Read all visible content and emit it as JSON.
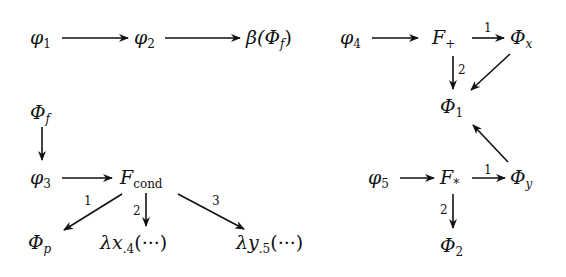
{
  "diagram": {
    "left_top_chain": {
      "nodes": [
        {
          "id": "phi1",
          "base": "φ",
          "sub": "1"
        },
        {
          "id": "phi2",
          "base": "φ",
          "sub": "2"
        },
        {
          "id": "beta_Phi_f",
          "prefix": "β(",
          "base": "Φ",
          "sub": "f",
          "suffix": ")"
        }
      ],
      "edges": [
        {
          "from": "phi1",
          "to": "phi2"
        },
        {
          "from": "phi2",
          "to": "beta_Phi_f"
        }
      ]
    },
    "left_bottom": {
      "nodes": [
        {
          "id": "Phi_f",
          "base": "Φ",
          "sub": "f"
        },
        {
          "id": "phi3",
          "base": "φ",
          "sub": "3"
        },
        {
          "id": "F_cond",
          "base": "F",
          "sub": "cond"
        },
        {
          "id": "Phi_p",
          "base": "Φ",
          "sub": "p"
        },
        {
          "id": "lambda_x",
          "base": "λx",
          "sub": ".4",
          "suffix": "(···)"
        },
        {
          "id": "lambda_y",
          "base": "λy",
          "sub": ".5",
          "suffix": "(···)"
        }
      ],
      "edges": [
        {
          "from": "Phi_f",
          "to": "phi3"
        },
        {
          "from": "phi3",
          "to": "F_cond"
        },
        {
          "from": "F_cond",
          "to": "Phi_p",
          "label": "1"
        },
        {
          "from": "F_cond",
          "to": "lambda_x",
          "label": "2"
        },
        {
          "from": "F_cond",
          "to": "lambda_y",
          "label": "3"
        }
      ]
    },
    "right": {
      "nodes": [
        {
          "id": "phi4",
          "base": "φ",
          "sub": "4"
        },
        {
          "id": "F_plus",
          "base": "F",
          "sub": "+"
        },
        {
          "id": "Phi_x",
          "base": "Φ",
          "sub": "x"
        },
        {
          "id": "Phi_1",
          "base": "Φ",
          "sub": "1"
        },
        {
          "id": "phi5",
          "base": "φ",
          "sub": "5"
        },
        {
          "id": "F_star",
          "base": "F",
          "sub": "*"
        },
        {
          "id": "Phi_y",
          "base": "Φ",
          "sub": "y"
        },
        {
          "id": "Phi_2",
          "base": "Φ",
          "sub": "2"
        }
      ],
      "edges": [
        {
          "from": "phi4",
          "to": "F_plus"
        },
        {
          "from": "F_plus",
          "to": "Phi_x",
          "label": "1"
        },
        {
          "from": "F_plus",
          "to": "Phi_1",
          "label": "2"
        },
        {
          "from": "Phi_x",
          "to": "Phi_1"
        },
        {
          "from": "phi5",
          "to": "F_star"
        },
        {
          "from": "F_star",
          "to": "Phi_y",
          "label": "1"
        },
        {
          "from": "F_star",
          "to": "Phi_2",
          "label": "2"
        },
        {
          "from": "Phi_y",
          "to": "Phi_1"
        }
      ]
    },
    "colors": {
      "ink": "#111111",
      "background": "#ffffff"
    }
  }
}
